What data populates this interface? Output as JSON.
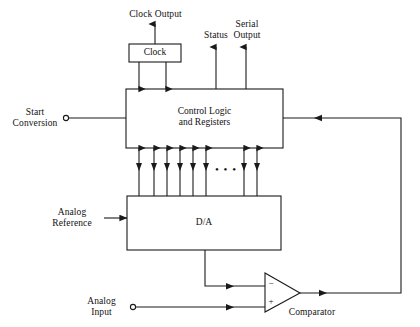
{
  "diagram": {
    "stroke_color": "#1a1a1a",
    "fill_color": "#ffffff",
    "background": "#ffffff"
  },
  "blocks": [
    {
      "id": "clock",
      "label": "Clock",
      "x": 129,
      "y": 44,
      "w": 52,
      "h": 18
    },
    {
      "id": "control",
      "label": "Control Logic\nand Registers",
      "x": 126,
      "y": 89,
      "w": 157,
      "h": 59
    },
    {
      "id": "dac",
      "label": "D/A",
      "x": 127,
      "y": 196,
      "w": 154,
      "h": 54
    }
  ],
  "comparator": {
    "id": "comparator",
    "label": "Comparator",
    "minus": "−",
    "plus": "+",
    "apex_x": 300,
    "apex_y": 293,
    "left_x": 265,
    "top_y": 273,
    "bottom_y": 312
  },
  "labels": {
    "clock_output": "Clock Output",
    "status": "Status",
    "serial_output": "Serial\nOutput",
    "start_conversion": "Start\nConversion",
    "analog_reference": "Analog\nReference",
    "analog_input": "Analog\nInput",
    "ellipsis": "• • •"
  },
  "bus": {
    "count": 8,
    "x_positions": [
      139,
      154,
      167,
      180,
      193,
      206,
      244,
      257
    ],
    "top_y": 148,
    "bottom_y": 196,
    "ellipsis_x": 225,
    "ellipsis_y": 172
  },
  "terminals": [
    {
      "id": "start-conversion-terminal",
      "x": 66,
      "y": 118,
      "r": 2.6
    },
    {
      "id": "analog-input-terminal",
      "x": 133,
      "y": 307,
      "r": 2.6
    }
  ],
  "signal_names": [
    "Clock Output",
    "Status",
    "Serial Output",
    "Start Conversion",
    "Analog Reference",
    "Analog Input",
    "Comparator feedback"
  ]
}
